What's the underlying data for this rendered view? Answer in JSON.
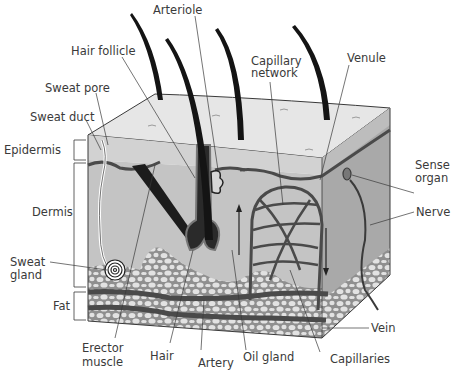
{
  "diagram": {
    "colors": {
      "epidermis_top": "#e6e6e6",
      "epidermis_band": "#cfcfcf",
      "dermis": "#c4c4c4",
      "side_face": "#a9a9a9",
      "fat_bg": "#8f8f8f",
      "fat_cells": "#e2e2e2",
      "vessel": "#4a4a4a",
      "hair": "#141414",
      "label_text": "#3a3a3a",
      "leader_line": "#3a3a3a"
    },
    "labels": {
      "arteriole": "Arteriole",
      "hair_follicle": "Hair follicle",
      "capillary_network_1": "Capillary",
      "capillary_network_2": "network",
      "venule": "Venule",
      "sweat_pore": "Sweat pore",
      "sweat_duct": "Sweat duct",
      "epidermis": "Epidermis",
      "dermis": "Dermis",
      "sense_organ_1": "Sense",
      "sense_organ_2": "organ",
      "nerve": "Nerve",
      "sweat_gland_1": "Sweat",
      "sweat_gland_2": "gland",
      "fat": "Fat",
      "vein": "Vein",
      "erector_muscle_1": "Erector",
      "erector_muscle_2": "muscle",
      "hair": "Hair",
      "artery": "Artery",
      "oil_gland": "Oil gland",
      "capillaries": "Capillaries"
    }
  }
}
